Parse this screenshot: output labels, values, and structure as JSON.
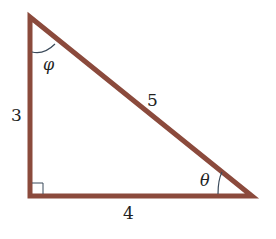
{
  "diagram": {
    "type": "right-triangle",
    "colors": {
      "edge": "#8B4A3C",
      "arc": "#3a4a5a",
      "text": "#222222",
      "background": "#ffffff"
    },
    "sides": {
      "vertical": "3",
      "hypotenuse": "5",
      "horizontal": "4"
    },
    "angles": {
      "top": "φ",
      "bottom_right": "θ"
    },
    "right_angle_marker": "bottom-left"
  }
}
